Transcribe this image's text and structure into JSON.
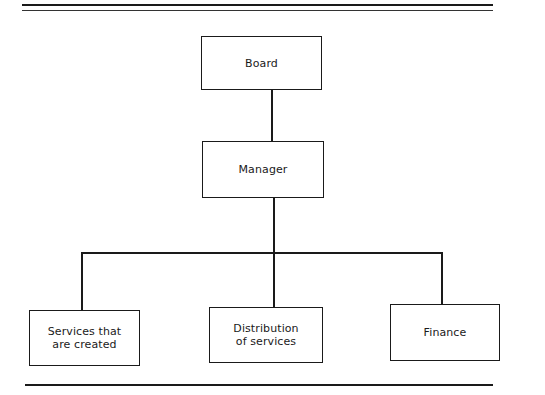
{
  "diagram": {
    "type": "org-chart",
    "nodes": [
      {
        "id": "board",
        "label_lines": [
          "Board"
        ],
        "level": 0
      },
      {
        "id": "manager",
        "label_lines": [
          "Manager"
        ],
        "level": 1,
        "parent": "board"
      },
      {
        "id": "services",
        "label_lines": [
          "Services that",
          "are created"
        ],
        "level": 2,
        "parent": "manager"
      },
      {
        "id": "distribution",
        "label_lines": [
          "Distribution",
          "of services"
        ],
        "level": 2,
        "parent": "manager"
      },
      {
        "id": "finance",
        "label_lines": [
          "Finance"
        ],
        "level": 2,
        "parent": "manager"
      }
    ],
    "edges": [
      {
        "from": "board",
        "to": "manager"
      },
      {
        "from": "manager",
        "to": "services"
      },
      {
        "from": "manager",
        "to": "distribution"
      },
      {
        "from": "manager",
        "to": "finance"
      }
    ],
    "colors": {
      "line": "#1a1a1a",
      "background": "#ffffff"
    }
  }
}
